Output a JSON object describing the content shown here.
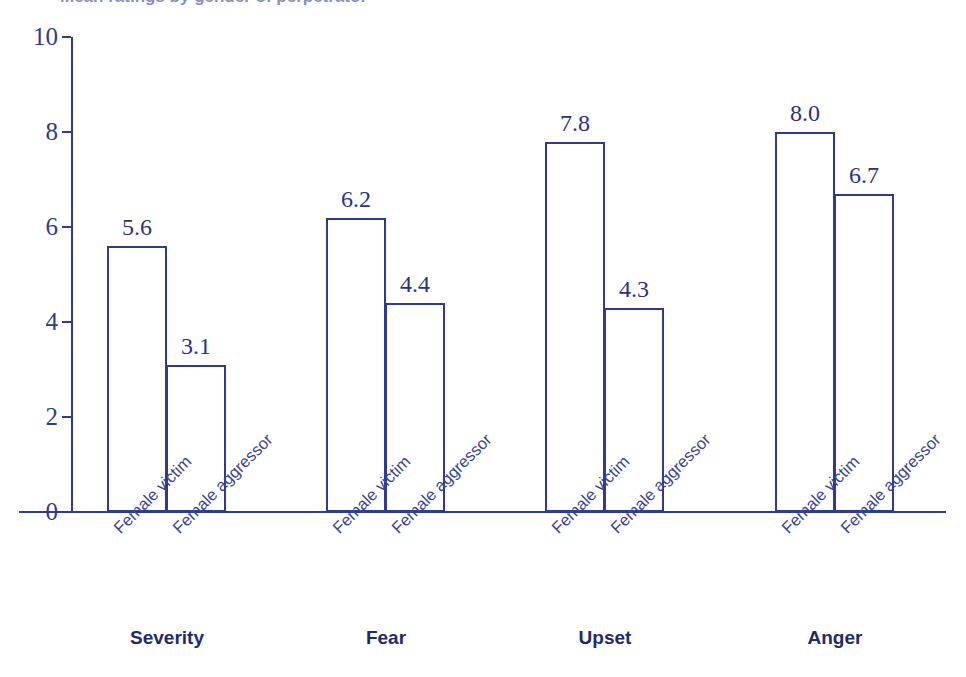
{
  "title": {
    "text": "Mean ratings by gender of perpetrator",
    "visible_partial": true
  },
  "chart_data": {
    "type": "bar",
    "title": "",
    "xlabel": "",
    "ylabel": "",
    "ylim": [
      0,
      10
    ],
    "yticks": [
      "0",
      "2",
      "4",
      "6",
      "8",
      "10"
    ],
    "ytick_values": [
      0,
      2,
      4,
      6,
      8,
      10
    ],
    "grid": false,
    "legend_position": "none",
    "categories": [
      "Severity",
      "Fear",
      "Upset",
      "Anger"
    ],
    "series": [
      {
        "name": "Female victim",
        "values": [
          5.6,
          6.2,
          7.8,
          8.0
        ]
      },
      {
        "name": "Female aggressor",
        "values": [
          3.1,
          4.4,
          4.3,
          6.7
        ]
      }
    ],
    "bar_labels": [
      [
        "5.6",
        "3.1"
      ],
      [
        "6.2",
        "4.4"
      ],
      [
        "7.8",
        "4.3"
      ],
      [
        "8.0",
        "6.7"
      ]
    ],
    "tick_labels": [
      [
        "Female victim",
        "Female aggressor"
      ],
      [
        "Female victim",
        "Female aggressor"
      ],
      [
        "Female victim",
        "Female aggressor"
      ],
      [
        "Female victim",
        "Female aggressor"
      ]
    ]
  },
  "colors": {
    "bar_outline": "#2e3b8f",
    "bar_fill": "#ffffff",
    "axis": "#2e3b8f",
    "value_label": "#2a3380",
    "tick_label": "#3b4590",
    "group_label": "#1f2a6e",
    "background": "#ffffff"
  }
}
